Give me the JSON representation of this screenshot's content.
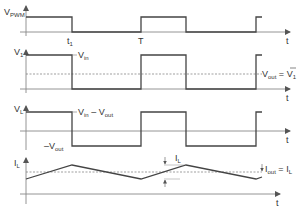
{
  "diagram": {
    "type": "buck-converter-waveforms",
    "plots": [
      {
        "id": "vpwm",
        "ylabel": "V",
        "ylabel_sub": "PWM",
        "xlabel": "t",
        "markers": [
          {
            "label": "t",
            "sub": "1"
          },
          {
            "label": "T"
          }
        ]
      },
      {
        "id": "v1",
        "ylabel": "V",
        "ylabel_sub": "1",
        "xlabel": "t",
        "high_label": "V",
        "high_label_sub": "in",
        "avg_label": "V",
        "avg_label_sub": "out",
        "avg_eq": " = ",
        "avg_rhs": "V",
        "avg_rhs_sub": "1",
        "avg_rhs_bar": "‾"
      },
      {
        "id": "vl",
        "ylabel": "V",
        "ylabel_sub": "L",
        "xlabel": "t",
        "high_label_a": "V",
        "high_label_a_sub": "in",
        "high_label_minus": " – ",
        "high_label_b": "V",
        "high_label_b_sub": "out",
        "low_label_minus": "–",
        "low_label": "V",
        "low_label_sub": "out"
      },
      {
        "id": "il",
        "ylabel": "I",
        "ylabel_sub": "L",
        "xlabel": "t",
        "ripple_label": "I",
        "ripple_label_sub": "L",
        "avg_label": "I",
        "avg_label_sub": "out",
        "avg_eq": " = ",
        "avg_rhs": "I",
        "avg_rhs_sub": "L",
        "avg_rhs_bar": "‾"
      }
    ]
  }
}
